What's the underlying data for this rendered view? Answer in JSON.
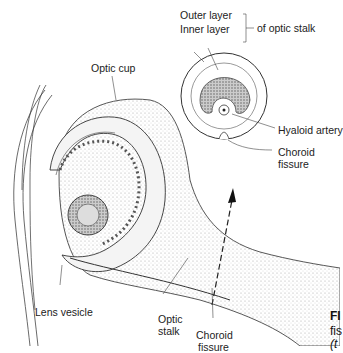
{
  "labels": {
    "outer_layer": "Outer layer",
    "inner_layer": "Inner layer",
    "of_optic_stalk": "of optic stalk",
    "optic_cup": "Optic cup",
    "hyaloid_artery": "Hyaloid artery",
    "choroid_fissure_top_1": "Choroid",
    "choroid_fissure_top_2": "fissure",
    "lens_vesicle": "Lens vesicle",
    "optic_stalk_1": "Optic",
    "optic_stalk_2": "stalk",
    "choroid_fissure_bottom_1": "Choroid",
    "choroid_fissure_bottom_2": "fissure"
  },
  "caption": {
    "fig_prefix": "FI",
    "line2": "fis",
    "line3": "(t"
  }
}
